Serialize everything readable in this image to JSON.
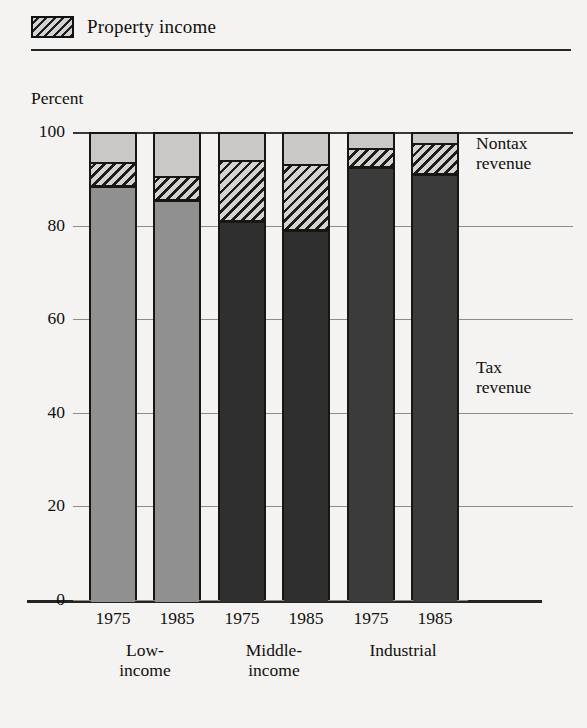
{
  "legend": {
    "swatch_icon": "hatch-swatch-icon",
    "label": "Property income"
  },
  "axis": {
    "y_title": "Percent",
    "y_ticks": [
      "100",
      "80",
      "60",
      "40",
      "20",
      "0"
    ]
  },
  "annotations": {
    "nontax": "Nontax\nrevenue",
    "nontax_line1": "Nontax",
    "nontax_line2": "revenue",
    "tax_line1": "Tax",
    "tax_line2": "revenue"
  },
  "groups": [
    {
      "name": "Low-income",
      "line1": "Low-",
      "line2": "income",
      "years": [
        "1975",
        "1985"
      ]
    },
    {
      "name": "Middle-income",
      "line1": "Middle-",
      "line2": "income",
      "years": [
        "1975",
        "1985"
      ]
    },
    {
      "name": "Industrial",
      "line1": "Industrial",
      "line2": "",
      "years": [
        "1975",
        "1985"
      ]
    }
  ],
  "colors": {
    "nontax_revenue": "#c9c8c6",
    "property_income_fill": "#d4d3d1",
    "property_income_hatch": "#1d1c18",
    "tax_low_income": "#909090",
    "tax_middle_income": "#2f2f2f",
    "tax_industrial": "#3b3b3b",
    "outline": "#17160f",
    "gridline": "#8d8b86",
    "rule": "#26241f",
    "background": "#f4f3f1"
  },
  "chart_data": {
    "type": "bar",
    "subtype": "stacked-100-percent",
    "title": "",
    "xlabel": "",
    "ylabel": "Percent",
    "ylim": [
      0,
      100
    ],
    "yticks": [
      0,
      20,
      40,
      60,
      80,
      100
    ],
    "grid": true,
    "legend_position": "top-left",
    "legend_entries": [
      "Property income"
    ],
    "series_order": [
      "Tax revenue",
      "Property income",
      "Nontax revenue"
    ],
    "categories": [
      "Low-income 1975",
      "Low-income 1985",
      "Middle-income 1975",
      "Middle-income 1985",
      "Industrial 1975",
      "Industrial 1985"
    ],
    "group_labels": [
      "Low-income",
      "Middle-income",
      "Industrial"
    ],
    "years": [
      "1975",
      "1985",
      "1975",
      "1985",
      "1975",
      "1985"
    ],
    "series": [
      {
        "name": "Tax revenue",
        "values": [
          88.5,
          85.5,
          81.0,
          79.0,
          92.5,
          91.0
        ]
      },
      {
        "name": "Property income",
        "values": [
          5.5,
          5.5,
          13.5,
          14.5,
          4.5,
          7.0
        ]
      },
      {
        "name": "Nontax revenue",
        "values": [
          6.0,
          9.0,
          5.5,
          6.5,
          3.0,
          2.0
        ]
      }
    ],
    "annotations": [
      {
        "text": "Nontax revenue",
        "position": "right-top"
      },
      {
        "text": "Tax revenue",
        "position": "right-middle"
      }
    ]
  },
  "bar_layout": {
    "x": [
      16,
      80,
      145,
      209,
      274,
      338
    ],
    "tax_colors": [
      "#909090",
      "#909090",
      "#2f2f2f",
      "#2f2f2f",
      "#3b3b3b",
      "#3b3b3b"
    ]
  }
}
